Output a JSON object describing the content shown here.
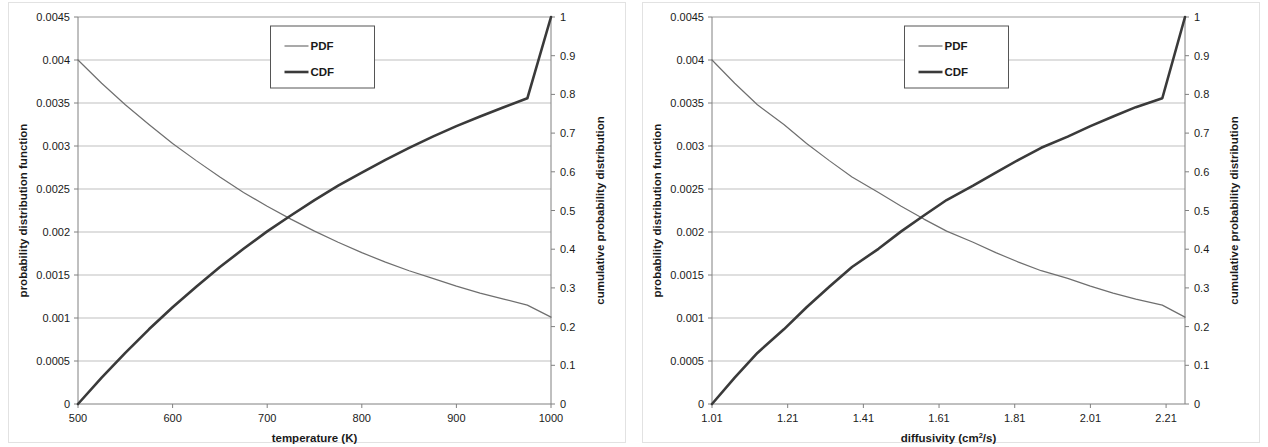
{
  "figure": {
    "panel_count": 2,
    "background": "#ffffff",
    "border_color": "#e2e2e2"
  },
  "style": {
    "pdf_color": "#6f6f6f",
    "cdf_color": "#3a3a3a",
    "grid_color": "#b8b8b8",
    "axis_color": "#808080",
    "text_color": "#1a1a1a",
    "legend_border": "#555555"
  },
  "chart_data": [
    {
      "type": "line",
      "id": "temperature-chart",
      "title": "",
      "xlabel": "temperature (K)",
      "ylabel": "probability distribution function",
      "y2label": "cumulative probability distribution",
      "xlim": [
        500,
        1000
      ],
      "ylim": [
        0,
        0.0045
      ],
      "y2lim": [
        0,
        1
      ],
      "grid": "horizontal",
      "legend_position": "top-center",
      "xticks": [
        500,
        600,
        700,
        800,
        900,
        1000
      ],
      "xticklabels": [
        "500",
        "600",
        "700",
        "800",
        "900",
        "1000"
      ],
      "yticks": [
        0,
        0.0005,
        0.001,
        0.0015,
        0.002,
        0.0025,
        0.003,
        0.0035,
        0.004,
        0.0045
      ],
      "yticklabels": [
        "0",
        "0.0005",
        "0.001",
        "0.0015",
        "0.002",
        "0.0025",
        "0.003",
        "0.0035",
        "0.004",
        "0.0045"
      ],
      "y2ticks": [
        0,
        0.1,
        0.2,
        0.3,
        0.4,
        0.5,
        0.6,
        0.7,
        0.8,
        0.9,
        1
      ],
      "y2ticklabels": [
        "0",
        "0.1",
        "0.2",
        "0.3",
        "0.4",
        "0.5",
        "0.6",
        "0.7",
        "0.8",
        "0.9",
        "1"
      ],
      "x": [
        500,
        525,
        550,
        575,
        600,
        625,
        650,
        675,
        700,
        725,
        750,
        775,
        800,
        825,
        850,
        875,
        900,
        925,
        950,
        975,
        1000
      ],
      "series": [
        {
          "name": "PDF",
          "axis": "left",
          "linewidth": 1.2,
          "values": [
            0.004,
            0.00373,
            0.00348,
            0.00325,
            0.00303,
            0.00283,
            0.00264,
            0.00246,
            0.0023,
            0.00215,
            0.00201,
            0.00188,
            0.00176,
            0.00165,
            0.00155,
            0.00146,
            0.00137,
            0.00129,
            0.00122,
            0.00115,
            0.00101
          ]
        },
        {
          "name": "CDF",
          "axis": "right",
          "linewidth": 2.6,
          "values": [
            0.0,
            0.068,
            0.132,
            0.193,
            0.25,
            0.303,
            0.354,
            0.401,
            0.446,
            0.487,
            0.527,
            0.564,
            0.598,
            0.631,
            0.662,
            0.691,
            0.718,
            0.743,
            0.767,
            0.79,
            1.0
          ]
        }
      ]
    },
    {
      "type": "line",
      "id": "diffusivity-chart",
      "title": "",
      "xlabel": "diffusivity (cm2/s)",
      "xlabel_base": "diffusivity (cm",
      "xlabel_sup": "2",
      "xlabel_tail": "/s)",
      "ylabel": "probability distribution function",
      "y2label": "cumulative probability distribution",
      "xlim": [
        1.01,
        2.26
      ],
      "ylim": [
        0,
        0.0045
      ],
      "y2lim": [
        0,
        1
      ],
      "grid": "horizontal",
      "legend_position": "top-center",
      "xticks": [
        1.01,
        1.21,
        1.41,
        1.61,
        1.81,
        2.01,
        2.21
      ],
      "xticklabels": [
        "1.01",
        "1.21",
        "1.41",
        "1.61",
        "1.81",
        "2.01",
        "2.21"
      ],
      "yticks": [
        0,
        0.0005,
        0.001,
        0.0015,
        0.002,
        0.0025,
        0.003,
        0.0035,
        0.004,
        0.0045
      ],
      "yticklabels": [
        "0",
        "0.0005",
        "0.001",
        "0.0015",
        "0.002",
        "0.0025",
        "0.003",
        "0.0035",
        "0.004",
        "0.0045"
      ],
      "y2ticks": [
        0,
        0.1,
        0.2,
        0.3,
        0.4,
        0.5,
        0.6,
        0.7,
        0.8,
        0.9,
        1
      ],
      "y2ticklabels": [
        "0",
        "0.1",
        "0.2",
        "0.3",
        "0.4",
        "0.5",
        "0.6",
        "0.7",
        "0.8",
        "0.9",
        "1"
      ],
      "x": [
        1.01,
        1.07,
        1.13,
        1.2,
        1.26,
        1.32,
        1.38,
        1.45,
        1.51,
        1.57,
        1.63,
        1.7,
        1.76,
        1.82,
        1.88,
        1.95,
        2.01,
        2.07,
        2.13,
        2.2,
        2.26
      ],
      "series": [
        {
          "name": "PDF",
          "axis": "left",
          "linewidth": 1.2,
          "values": [
            0.004,
            0.00373,
            0.00348,
            0.00325,
            0.00303,
            0.00283,
            0.00264,
            0.00246,
            0.0023,
            0.00215,
            0.00201,
            0.00188,
            0.00176,
            0.00165,
            0.00155,
            0.00146,
            0.00137,
            0.00129,
            0.00122,
            0.00115,
            0.00101
          ]
        },
        {
          "name": "CDF",
          "axis": "right",
          "linewidth": 2.6,
          "values": [
            0.0,
            0.068,
            0.132,
            0.193,
            0.25,
            0.303,
            0.354,
            0.401,
            0.446,
            0.487,
            0.527,
            0.564,
            0.598,
            0.631,
            0.662,
            0.691,
            0.718,
            0.743,
            0.767,
            0.79,
            1.0
          ]
        }
      ]
    }
  ]
}
